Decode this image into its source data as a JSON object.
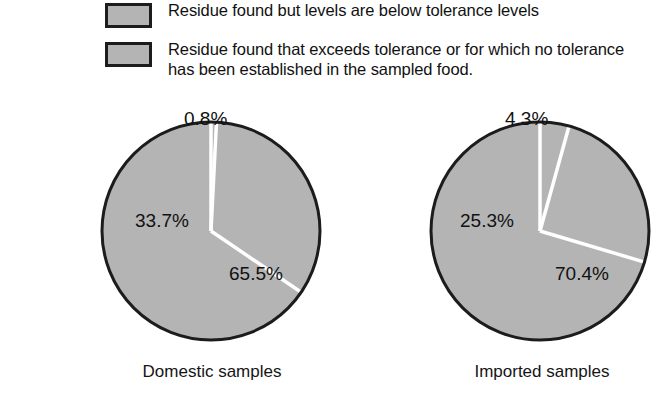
{
  "legend": {
    "items": [
      {
        "swatch_name": "legend-swatch-below-tolerance",
        "color": "#b4b4b4",
        "label": "Residue found but levels are below tolerance levels"
      },
      {
        "swatch_name": "legend-swatch-exceeds-tolerance",
        "color": "#b4b4b4",
        "label": "Residue found that exceeds tolerance or for which no tolerance has been established in the sampled food."
      }
    ]
  },
  "side_caption": {
    "lines": [
      "erances",
      "estically",
      "ood",
      "esticide",
      "and"
    ]
  },
  "chart_data": {
    "type": "pie",
    "title": "",
    "legend_position": "top",
    "charts": [
      {
        "name": "domestic-samples",
        "label": "Domestic samples",
        "categories": [
          "Residue found that exceeds tolerance or for which no tolerance has been established in the sampled food.",
          "Residue found but levels are below tolerance levels",
          "No residue found"
        ],
        "values": [
          0.8,
          33.7,
          65.5
        ],
        "data_labels": [
          "0.8%",
          "33.7%",
          "65.5%"
        ],
        "slice_color": "#b4b4b4",
        "divider_color": "#ffffff",
        "outline_color": "#1c1c1c"
      },
      {
        "name": "imported-samples",
        "label": "Imported samples",
        "categories": [
          "Residue found that exceeds tolerance or for which no tolerance has been established in the sampled food.",
          "Residue found but levels are below tolerance levels",
          "No residue found"
        ],
        "values": [
          4.3,
          25.3,
          70.4
        ],
        "data_labels": [
          "4.3%",
          "25.3%",
          "70.4%"
        ],
        "slice_color": "#b4b4b4",
        "divider_color": "#ffffff",
        "outline_color": "#1c1c1c"
      }
    ]
  }
}
